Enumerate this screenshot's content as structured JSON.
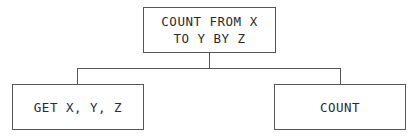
{
  "diagram": {
    "type": "hierarchy-chart",
    "root": {
      "label": "COUNT FROM X\nTO Y BY Z"
    },
    "children": [
      {
        "label": "GET X, Y, Z"
      },
      {
        "label": "COUNT"
      }
    ],
    "colors": {
      "stroke": "#555555",
      "text": "#2a2a2a",
      "background": "#ffffff"
    }
  }
}
